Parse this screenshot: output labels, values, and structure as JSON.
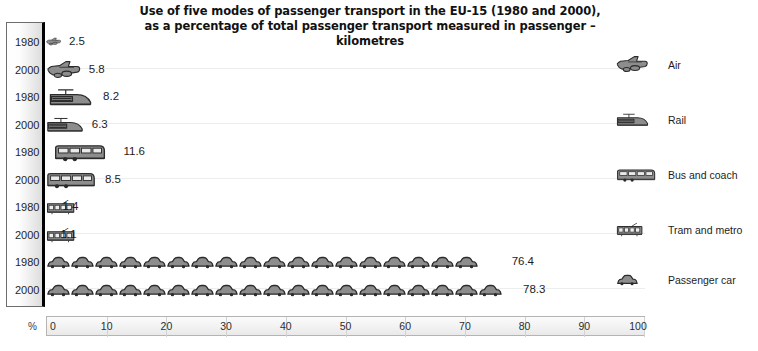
{
  "chart_data": {
    "type": "bar",
    "title": "Use of five modes of passenger transport in the EU-15 (1980 and 2000), as a percentage of total passenger transport measured in passenger – kilometres",
    "title_line1": "Use of five modes of passenger transport in the EU-15 (1980 and 2000),",
    "title_line2": "as a percentage of total passenger transport measured in passenger – kilometres",
    "xlabel": "%",
    "ylabel": "",
    "xlim": [
      0,
      100
    ],
    "xticks": [
      0,
      10,
      20,
      30,
      40,
      50,
      60,
      70,
      80,
      90,
      100
    ],
    "xticklabels": [
      "0",
      "10",
      "20",
      "30",
      "40",
      "50",
      "60",
      "70",
      "80",
      "90",
      "100"
    ],
    "grid": false,
    "legend_position": "right",
    "categories": [
      "Air",
      "Rail",
      "Bus and coach",
      "Tram and metro",
      "Passenger car"
    ],
    "series": [
      {
        "name": "1980",
        "values": [
          2.5,
          8.2,
          11.6,
          1.4,
          76.4
        ]
      },
      {
        "name": "2000",
        "values": [
          5.8,
          6.3,
          8.5,
          1.1,
          78.3
        ]
      }
    ],
    "rows": [
      {
        "mode": "Air",
        "icon": "airplane-icon",
        "year": "1980",
        "value": 2.5,
        "label": "2.5"
      },
      {
        "mode": "Air",
        "icon": "airplane-icon",
        "year": "2000",
        "value": 5.8,
        "label": "5.8"
      },
      {
        "mode": "Rail",
        "icon": "train-icon",
        "year": "1980",
        "value": 8.2,
        "label": "8.2"
      },
      {
        "mode": "Rail",
        "icon": "train-icon",
        "year": "2000",
        "value": 6.3,
        "label": "6.3"
      },
      {
        "mode": "Bus and coach",
        "icon": "bus-icon",
        "year": "1980",
        "value": 11.6,
        "label": "11.6"
      },
      {
        "mode": "Bus and coach",
        "icon": "bus-icon",
        "year": "2000",
        "value": 8.5,
        "label": "8.5"
      },
      {
        "mode": "Tram and metro",
        "icon": "tram-icon",
        "year": "1980",
        "value": 1.4,
        "label": "1.4"
      },
      {
        "mode": "Tram and metro",
        "icon": "tram-icon",
        "year": "2000",
        "value": 1.1,
        "label": "1.1"
      },
      {
        "mode": "Passenger car",
        "icon": "car-icon",
        "year": "1980",
        "value": 76.4,
        "label": "76.4"
      },
      {
        "mode": "Passenger car",
        "icon": "car-icon",
        "year": "2000",
        "value": 78.3,
        "label": "78.3"
      }
    ]
  },
  "years": {
    "y0": "1980",
    "y1": "2000",
    "y2": "1980",
    "y3": "2000",
    "y4": "1980",
    "y5": "2000",
    "y6": "1980",
    "y7": "2000",
    "y8": "1980",
    "y9": "2000"
  },
  "values": {
    "air_1980": "2.5",
    "air_2000": "5.8",
    "rail_1980": "8.2",
    "rail_2000": "6.3",
    "bus_1980": "11.6",
    "bus_2000": "8.5",
    "tram_1980": "1.4",
    "tram_2000": "1.1",
    "car_1980": "76.4",
    "car_2000": "78.3"
  },
  "legend": {
    "items": [
      {
        "label": "Air",
        "icon": "airplane-icon"
      },
      {
        "label": "Rail",
        "icon": "train-icon"
      },
      {
        "label": "Bus and coach",
        "icon": "bus-icon"
      },
      {
        "label": "Tram and metro",
        "icon": "tram-icon"
      },
      {
        "label": "Passenger car",
        "icon": "car-icon"
      }
    ]
  },
  "axis": {
    "percent_symbol": "%",
    "labels": [
      "0",
      "10",
      "20",
      "30",
      "40",
      "50",
      "60",
      "70",
      "80",
      "90",
      "100"
    ]
  },
  "colors": {
    "icon_fill": "#8d8d8d",
    "icon_stroke": "#2b2b2b",
    "text": "#1d1d1d",
    "axis_border": "#b4b4b4",
    "rowline": "#eceded"
  }
}
